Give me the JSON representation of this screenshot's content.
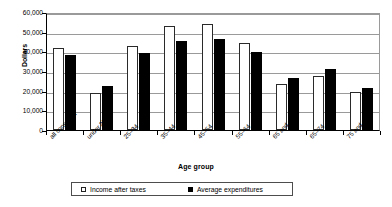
{
  "chart_data": {
    "type": "bar",
    "title": "",
    "xlabel": "Age group",
    "ylabel": "Dollars",
    "ylim": [
      0,
      60000
    ],
    "ytick_labels": [
      "60,000",
      "50,000",
      "40,000",
      "30,000",
      "20,000",
      "10,000",
      "0"
    ],
    "ytick_values": [
      60000,
      50000,
      40000,
      30000,
      20000,
      10000,
      0
    ],
    "grid": true,
    "legend_position": "bottom",
    "categories": [
      "all consumer",
      "under 25",
      "25–34",
      "35–44",
      "45–54",
      "55–64",
      "65 and over",
      "65–74",
      "75 and over"
    ],
    "series": [
      {
        "name": "Income after taxes",
        "color": "#ffffff",
        "edge_color": "#2a2a2a",
        "values": [
          41500,
          18800,
          42700,
          52700,
          54000,
          44000,
          23500,
          27500,
          19500
        ]
      },
      {
        "name": "Average expenditures",
        "color": "#000000",
        "edge_color": "#000000",
        "values": [
          38000,
          22500,
          39000,
          45300,
          46200,
          39500,
          26500,
          31000,
          21500
        ]
      }
    ]
  },
  "legend": {
    "items": [
      {
        "label": "Income after taxes",
        "swatch": "open-square"
      },
      {
        "label": "Average expenditures",
        "swatch": "filled-square"
      }
    ]
  }
}
